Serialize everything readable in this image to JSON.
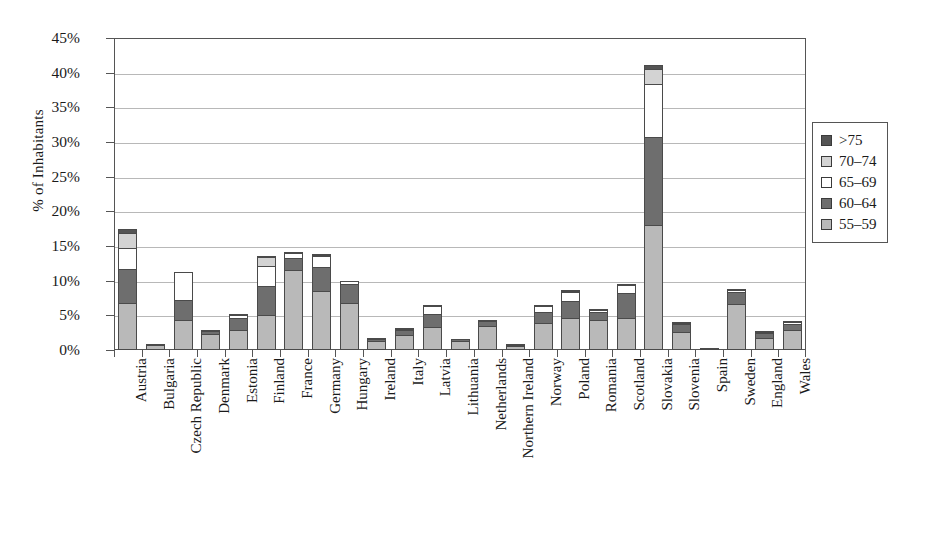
{
  "chart_data": {
    "type": "bar",
    "subtype": "stacked-bar-vertical",
    "title": "",
    "xlabel": "",
    "ylabel": "% of Inhabitants",
    "ylim": [
      0,
      45
    ],
    "ytick_step": 5,
    "ytick_labels": [
      "0%",
      "5%",
      "10%",
      "15%",
      "20%",
      "25%",
      "30%",
      "35%",
      "40%",
      "45%"
    ],
    "ytick_values": [
      0,
      5,
      10,
      15,
      20,
      25,
      30,
      35,
      40,
      45
    ],
    "grid": "horizontal",
    "legend_position": "right",
    "legend_order_top_to_bottom": [
      ">75",
      "70–74",
      "65–69",
      "60–64",
      "55–59"
    ],
    "stack_order_bottom_to_top": [
      "55–59",
      "60–64",
      "65–69",
      "70–74",
      ">75"
    ],
    "categories": [
      "Austria",
      "Bulgaria",
      "Czech Republic",
      "Denmark",
      "Estonia",
      "Finland",
      "France",
      "Germany",
      "Hungary",
      "Ireland",
      "Italy",
      "Latvia",
      "Lithuania",
      "Netherlands",
      "Northern Ireland",
      "Norway",
      "Poland",
      "Romania",
      "Scotland",
      "Slovakia",
      "Slovenia",
      "Spain",
      "Sweden",
      "England",
      "Wales"
    ],
    "series": [
      {
        "name": "55–59",
        "color": "#b9b9b9",
        "values": [
          6.8,
          0.7,
          4.3,
          2.3,
          2.9,
          5.0,
          11.5,
          8.5,
          6.8,
          1.3,
          2.1,
          3.3,
          1.3,
          3.5,
          0.6,
          3.9,
          4.6,
          4.4,
          4.6,
          18.0,
          2.6,
          0.2,
          6.6,
          1.8,
          2.9
        ]
      },
      {
        "name": "60–64",
        "color": "#6e6e6e",
        "values": [
          5.1,
          0.3,
          3.1,
          0.6,
          1.9,
          4.4,
          1.9,
          3.6,
          2.8,
          0.5,
          0.9,
          2.0,
          0.4,
          0.8,
          0.3,
          1.7,
          2.6,
          1.3,
          3.7,
          12.9,
          1.3,
          0.1,
          1.9,
          0.8,
          1.0
        ]
      },
      {
        "name": "65–69",
        "color": "#ffffff",
        "values": [
          3.1,
          0.0,
          4.2,
          0.1,
          0.6,
          3.0,
          0.9,
          1.7,
          0.7,
          0.2,
          0.3,
          1.3,
          0.0,
          0.1,
          0.1,
          1.1,
          1.5,
          0.3,
          1.4,
          7.7,
          0.3,
          0.0,
          0.5,
          0.3,
          0.5
        ]
      },
      {
        "name": "70–74",
        "color": "#d3d3d3",
        "values": [
          2.3,
          0.0,
          0.0,
          0.0,
          0.1,
          1.5,
          0.0,
          0.4,
          0.0,
          0.0,
          0.1,
          0.2,
          0.0,
          0.1,
          0.0,
          0.2,
          0.3,
          0.1,
          0.2,
          2.3,
          0.1,
          0.0,
          0.1,
          0.1,
          0.1
        ]
      },
      {
        "name": ">75",
        "color": "#545454",
        "values": [
          0.8,
          0.0,
          0.0,
          0.0,
          0.0,
          0.2,
          0.2,
          0.3,
          0.0,
          0.0,
          0.1,
          0.1,
          0.0,
          0.1,
          0.0,
          0.1,
          0.1,
          0.1,
          0.1,
          0.8,
          0.0,
          0.0,
          0.1,
          0.1,
          0.1
        ]
      }
    ],
    "totals": [
      18.1,
      1.0,
      11.6,
      3.0,
      5.5,
      14.1,
      14.5,
      14.5,
      10.3,
      2.0,
      3.5,
      6.9,
      1.7,
      4.6,
      1.0,
      7.0,
      9.1,
      6.2,
      10.0,
      41.7,
      4.3,
      0.3,
      9.2,
      3.1,
      4.6
    ]
  },
  "legend": {
    "items": [
      {
        "label": ">75",
        "color": "#545454"
      },
      {
        "label": "70–74",
        "color": "#d3d3d3"
      },
      {
        "label": "65–69",
        "color": "#ffffff"
      },
      {
        "label": "60–64",
        "color": "#6e6e6e"
      },
      {
        "label": "55–59",
        "color": "#b9b9b9"
      }
    ]
  },
  "axes": {
    "y_title": "% of Inhabitants"
  },
  "colors": {
    "axis": "#555555",
    "grid": "#8c8c8c",
    "background": "#ffffff",
    "text": "#1a1a1a"
  }
}
